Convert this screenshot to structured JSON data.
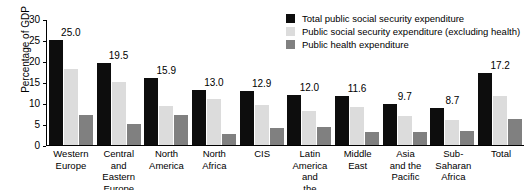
{
  "chart_data": {
    "type": "bar",
    "title": "",
    "xlabel": "",
    "ylabel": "Percentage of GDP",
    "ylim": [
      0,
      30
    ],
    "ytick_step": 5,
    "yticks": [
      "30",
      "25",
      "20",
      "15",
      "10",
      "5",
      "0"
    ],
    "grid": false,
    "legend_position": "top-right",
    "categories": [
      "Western\nEurope",
      "Central and\nEastern\nEurope",
      "North\nAmerica",
      "North\nAfrica",
      "CIS",
      "Latin America\nand\nthe Caribbean",
      "Middle\nEast",
      "Asia\nand the\nPacific",
      "Sub-\nSaharan\nAfrica",
      "Total"
    ],
    "series": [
      {
        "name": "Total public social security expenditure",
        "color": "#0d0d0d",
        "values": [
          25.0,
          19.5,
          15.9,
          13.0,
          12.9,
          12.0,
          11.6,
          9.7,
          8.7,
          17.2
        ],
        "labels": [
          "25.0",
          "19.5",
          "15.9",
          "13.0",
          "12.9",
          "12.0",
          "11.6",
          "9.7",
          "8.7",
          "17.2"
        ]
      },
      {
        "name": "Public social security expenditure (excluding health)",
        "color": "#dcdcdc",
        "values": [
          18.2,
          14.9,
          9.2,
          10.9,
          9.5,
          8.2,
          9.1,
          7.0,
          5.9,
          11.7
        ]
      },
      {
        "name": "Public health expenditure",
        "color": "#808080",
        "values": [
          7.1,
          5.1,
          7.1,
          2.6,
          4.1,
          4.4,
          3.0,
          3.2,
          3.4,
          6.1
        ]
      }
    ]
  },
  "legend": {
    "items": [
      {
        "label": "Total public social security expenditure",
        "swatch": "total-swatch"
      },
      {
        "label": "Public social security expenditure (excluding health)",
        "swatch": "excluding-health-swatch"
      },
      {
        "label": "Public health expenditure",
        "swatch": "health-swatch"
      }
    ]
  }
}
